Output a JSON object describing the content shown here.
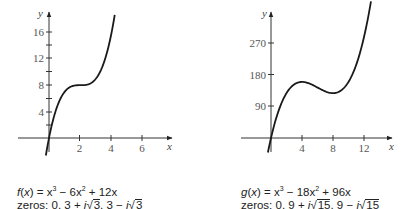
{
  "chart_data": [
    {
      "type": "line",
      "title": "",
      "function_label": "f(x) = x^3 - 6x^2 + 12x",
      "zeros_label": "zeros: 0, 3 + i√3, 3 - i√3",
      "xlabel": "x",
      "ylabel": "y",
      "xticks": [
        2,
        4,
        6
      ],
      "yticks": [
        4,
        8,
        12,
        16
      ],
      "minor_yticks": [
        2,
        6,
        10,
        14
      ],
      "xlim": [
        -1,
        7.8
      ],
      "ylim": [
        -3,
        19
      ],
      "grid": false,
      "series": [
        {
          "name": "f(x)",
          "x": [
            -0.2,
            0,
            0.25,
            0.5,
            0.75,
            1,
            1.5,
            2,
            2.5,
            3,
            3.5,
            4,
            4.2
          ],
          "y": [
            -2.65,
            0,
            2.64,
            4.63,
            6.05,
            7,
            7.88,
            8,
            8.13,
            9,
            11.38,
            16,
            17.77
          ]
        }
      ]
    },
    {
      "type": "line",
      "title": "",
      "function_label": "g(x) = x^3 - 18x^2 + 96x",
      "zeros_label": "zeros: 0, 9 + i√15, 9 - i√15",
      "xlabel": "x",
      "ylabel": "y",
      "xticks": [
        4,
        8,
        12
      ],
      "yticks": [
        90,
        180,
        270
      ],
      "xlim": [
        -2,
        15.5
      ],
      "ylim": [
        -50,
        360
      ],
      "grid": false,
      "series": [
        {
          "name": "g(x)",
          "x": [
            -0.4,
            0,
            1,
            2,
            3,
            4,
            5,
            6,
            7,
            8,
            9,
            10,
            11,
            12,
            12.9
          ],
          "y": [
            -41.3,
            0,
            79,
            128,
            153,
            160,
            155,
            144,
            133,
            128,
            135,
            160,
            209,
            288,
            380
          ]
        }
      ]
    }
  ],
  "left": {
    "y_axis_label": "y",
    "x_axis_label": "x",
    "y_tick_labels": [
      "16",
      "12",
      "8",
      "4"
    ],
    "x_tick_labels": [
      "2",
      "4",
      "6"
    ],
    "caption_fn_name": "f",
    "caption_line1_rest": " = x",
    "caption_line1_a": " − 6x",
    "caption_line1_b": " + 12x",
    "caption_zeros_prefix": "zeros: 0, 3 + ",
    "caption_zeros_i": "i",
    "caption_zeros_rad1": "3",
    "caption_zeros_mid": ", 3 − ",
    "caption_zeros_rad2": "3"
  },
  "right": {
    "y_axis_label": "y",
    "x_axis_label": "x",
    "y_tick_labels": [
      "270",
      "180",
      "90"
    ],
    "x_tick_labels": [
      "4",
      "8",
      "12"
    ],
    "caption_fn_name": "g",
    "caption_line1_rest": " = x",
    "caption_line1_a": " − 18x",
    "caption_line1_b": " + 96x",
    "caption_zeros_prefix": "zeros: 0, 9 + ",
    "caption_zeros_i": "i",
    "caption_zeros_rad1": "15",
    "caption_zeros_mid": ", 9 − ",
    "caption_zeros_rad2": "15"
  },
  "colors": {
    "curve": "#1a1a1a",
    "axis": "#333333",
    "text": "#222222"
  }
}
